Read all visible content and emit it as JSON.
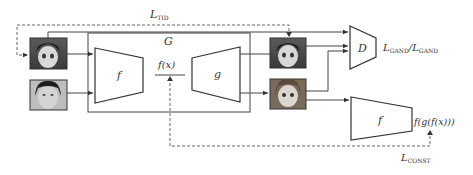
{
  "diagram": {
    "generator_label": "G",
    "encoder_label": "f",
    "decoder_label": "g",
    "latent_label": "f(x)",
    "discriminator_label": "D",
    "discriminator_loss": {
      "main": "L",
      "sub1": "GAND",
      "sep": "/",
      "sub2": "GAND"
    },
    "tid_loss": {
      "main": "L",
      "sub": "TID"
    },
    "const_loss": {
      "main": "L",
      "sub": "CONST"
    },
    "encoder2_label": "f",
    "cycle_output_label": "f(g(f(x)))",
    "images": {
      "input_anime": "anime-face-input",
      "input_photo": "real-face-input",
      "output_anime_identity": "anime-face-output",
      "output_anime_translated": "translated-anime-face-output"
    },
    "colors": {
      "line": "#444444",
      "text": "#333333",
      "background": "#ffffff"
    }
  }
}
